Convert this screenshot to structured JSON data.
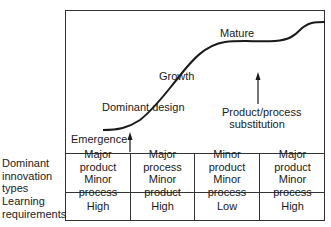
{
  "diagram": {
    "stages": {
      "emergence": "Emergence",
      "dominant_design": "Dominant design",
      "growth": "Growth",
      "mature": "Mature"
    },
    "annotations": {
      "substitution_line1": "Product/process",
      "substitution_line2": "substitution"
    },
    "table": {
      "row_labels": [
        {
          "line1": "Dominant",
          "line2": "innovation",
          "line3": "types"
        },
        {
          "line1": "Learning",
          "line2": "requirements"
        }
      ],
      "innovation_types": [
        {
          "line1": "Major product",
          "line2": "Minor process"
        },
        {
          "line1": "Major process",
          "line2": "Minor product"
        },
        {
          "line1": "Minor product",
          "line2": "Minor process"
        },
        {
          "line1": "Major product",
          "line2": "Minor process"
        }
      ],
      "learning_requirements": [
        "High",
        "High",
        "Low",
        "High"
      ]
    },
    "colors": {
      "line": "#1a1a1a",
      "border": "#333333",
      "background": "#ffffff"
    }
  }
}
